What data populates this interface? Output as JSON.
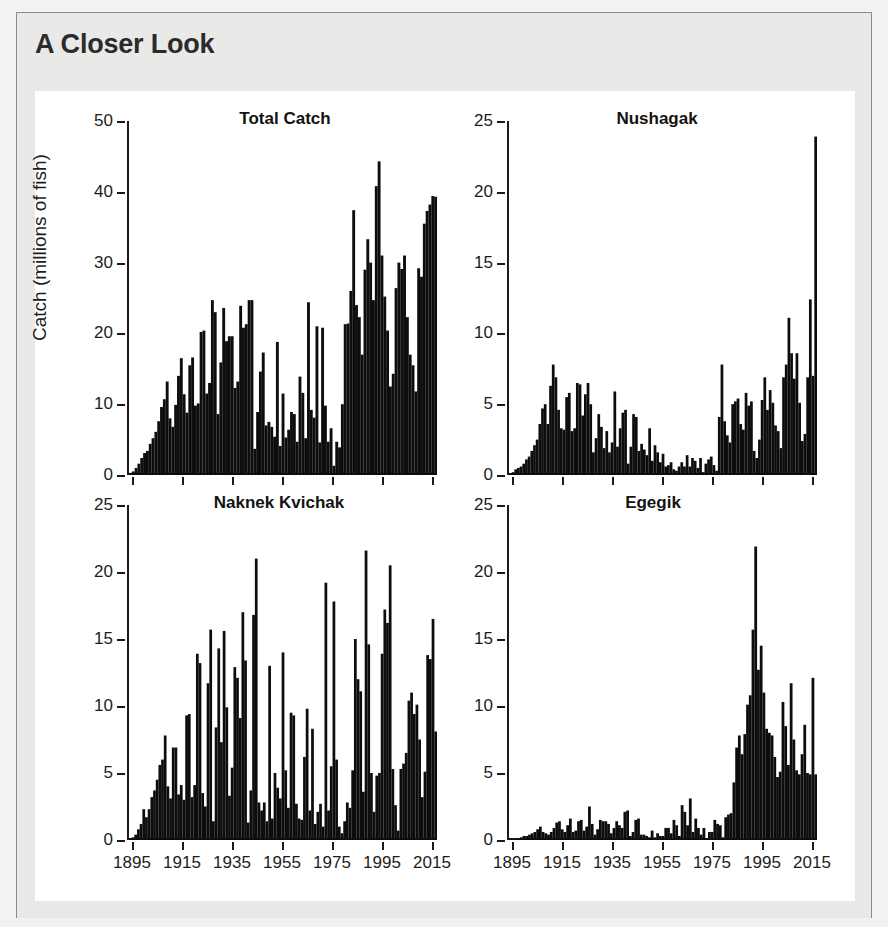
{
  "header": {
    "title": "A Closer Look"
  },
  "figure": {
    "y_axis_title": "Catch (millions of fish)"
  },
  "chart_data": [
    {
      "type": "bar",
      "panel": "top-left",
      "title": "Total Catch",
      "xlabel": "",
      "ylabel": "Catch (millions of fish)",
      "ylim": [
        0,
        50
      ],
      "yticks": [
        0,
        10,
        20,
        30,
        40,
        50
      ],
      "xlim": [
        1893,
        2017
      ],
      "xticks": [
        1895,
        1915,
        1935,
        1955,
        1975,
        1995,
        2015
      ],
      "grid": false,
      "legend": "none",
      "x": [
        1893,
        1894,
        1895,
        1896,
        1897,
        1898,
        1899,
        1900,
        1901,
        1902,
        1903,
        1904,
        1905,
        1906,
        1907,
        1908,
        1909,
        1910,
        1911,
        1912,
        1913,
        1914,
        1915,
        1916,
        1917,
        1918,
        1919,
        1920,
        1921,
        1922,
        1923,
        1924,
        1925,
        1926,
        1927,
        1928,
        1929,
        1930,
        1931,
        1932,
        1933,
        1934,
        1935,
        1936,
        1937,
        1938,
        1939,
        1940,
        1941,
        1942,
        1943,
        1944,
        1945,
        1946,
        1947,
        1948,
        1949,
        1950,
        1951,
        1952,
        1953,
        1954,
        1955,
        1956,
        1957,
        1958,
        1959,
        1960,
        1961,
        1962,
        1963,
        1964,
        1965,
        1966,
        1967,
        1968,
        1969,
        1970,
        1971,
        1972,
        1973,
        1974,
        1975,
        1976,
        1977,
        1978,
        1979,
        1980,
        1981,
        1982,
        1983,
        1984,
        1985,
        1986,
        1987,
        1988,
        1989,
        1990,
        1991,
        1992,
        1993,
        1994,
        1995,
        1996,
        1997,
        1998,
        1999,
        2000,
        2001,
        2002,
        2003,
        2004,
        2005,
        2006,
        2007,
        2008,
        2009,
        2010,
        2011,
        2012,
        2013,
        2014,
        2015,
        2016
      ],
      "values": [
        0.3,
        0.5,
        1.0,
        1.6,
        2.4,
        3.1,
        3.4,
        4.4,
        5.2,
        6.1,
        7.6,
        9.6,
        10.7,
        13.2,
        8.0,
        6.8,
        9.9,
        14.0,
        16.5,
        11.4,
        8.8,
        15.5,
        16.6,
        9.8,
        10.1,
        20.2,
        20.4,
        11.5,
        13.0,
        24.7,
        23.0,
        8.6,
        15.9,
        23.6,
        18.9,
        19.6,
        19.6,
        12.3,
        13.2,
        23.9,
        20.8,
        21.3,
        24.7,
        24.7,
        3.7,
        8.9,
        14.6,
        17.3,
        7.0,
        7.5,
        6.8,
        5.4,
        18.8,
        4.1,
        11.5,
        5.3,
        6.4,
        8.9,
        8.6,
        4.7,
        13.9,
        11.6,
        5.2,
        24.4,
        9.2,
        8.1,
        21.0,
        4.6,
        20.8,
        9.8,
        4.7,
        6.6,
        1.3,
        4.7,
        3.9,
        10.0,
        21.3,
        21.4,
        26.0,
        37.4,
        24.0,
        22.3,
        17.0,
        29.0,
        33.3,
        30.0,
        24.7,
        40.8,
        44.3,
        31.0,
        25.2,
        20.4,
        12.5,
        14.3,
        26.4,
        30.0,
        29.1,
        31.0,
        22.3,
        17.0,
        15.5,
        11.8,
        29.2,
        28.0,
        35.5,
        37.3,
        38.2,
        39.4,
        39.3
      ]
    },
    {
      "type": "bar",
      "panel": "top-right",
      "title": "Nushagak",
      "xlabel": "",
      "ylabel": "",
      "ylim": [
        0,
        25
      ],
      "yticks": [
        0,
        5,
        10,
        15,
        20,
        25
      ],
      "xlim": [
        1893,
        2017
      ],
      "xticks": [
        1895,
        1915,
        1935,
        1955,
        1975,
        1995,
        2015
      ],
      "grid": false,
      "legend": "none",
      "values": [
        0.1,
        0.2,
        0.4,
        0.5,
        0.6,
        0.8,
        1.1,
        1.3,
        1.7,
        2.1,
        2.5,
        3.6,
        4.7,
        5.0,
        3.6,
        6.3,
        7.8,
        6.9,
        4.6,
        3.3,
        3.2,
        5.5,
        5.8,
        3.1,
        3.3,
        6.5,
        6.4,
        4.2,
        5.7,
        6.5,
        5.0,
        1.6,
        2.6,
        4.3,
        3.4,
        1.9,
        3.1,
        1.6,
        2.3,
        5.9,
        2.0,
        3.3,
        4.4,
        4.6,
        0.8,
        2.0,
        4.3,
        4.1,
        1.7,
        2.2,
        1.8,
        1.4,
        3.3,
        1.0,
        2.1,
        1.6,
        0.9,
        1.5,
        0.6,
        0.7,
        0.9,
        0.4,
        0.3,
        0.6,
        0.9,
        0.6,
        1.4,
        0.6,
        1.2,
        1.0,
        0.5,
        1.2,
        0.2,
        0.8,
        1.1,
        1.3,
        0.7,
        0.3,
        4.1,
        7.8,
        3.8,
        2.8,
        2.3,
        5.0,
        5.2,
        5.4,
        3.6,
        3.2,
        5.8,
        4.9,
        5.2,
        1.7,
        1.2,
        2.5,
        5.3,
        6.9,
        4.6,
        6.0,
        5.1,
        3.5,
        3.1,
        1.9,
        6.9,
        7.8,
        11.1,
        8.6,
        6.8,
        8.6,
        5.1,
        2.4,
        2.9,
        6.9,
        12.4,
        7.0,
        23.9
      ]
    },
    {
      "type": "bar",
      "panel": "bottom-left",
      "title": "Naknek Kvichak",
      "xlabel": "",
      "ylabel": "",
      "ylim": [
        0,
        25
      ],
      "yticks": [
        0,
        5,
        10,
        15,
        20,
        25
      ],
      "xlim": [
        1893,
        2017
      ],
      "xticks": [
        1895,
        1915,
        1935,
        1955,
        1975,
        1995,
        2015
      ],
      "grid": false,
      "legend": "none",
      "values": [
        0.1,
        0.2,
        0.4,
        0.8,
        1.2,
        2.3,
        1.7,
        2.3,
        3.2,
        3.7,
        4.5,
        5.6,
        6.0,
        7.8,
        4.0,
        3.1,
        6.9,
        6.9,
        3.4,
        4.1,
        3.0,
        9.3,
        9.4,
        3.2,
        4.1,
        13.9,
        13.2,
        3.5,
        2.5,
        11.7,
        15.7,
        1.4,
        8.4,
        14.3,
        7.3,
        15.6,
        9.9,
        3.3,
        5.4,
        12.9,
        12.1,
        9.1,
        17.0,
        13.4,
        1.3,
        3.7,
        16.8,
        21.0,
        2.8,
        2.2,
        2.8,
        1.4,
        13.0,
        1.6,
        5.0,
        3.9,
        3.1,
        14.0,
        5.2,
        2.4,
        9.5,
        9.3,
        2.7,
        1.6,
        1.5,
        6.2,
        9.8,
        2.2,
        8.3,
        1.2,
        2.1,
        2.7,
        1.0,
        19.2,
        2.2,
        5.5,
        17.8,
        6.0,
        1.0,
        0.5,
        1.4,
        2.8,
        2.4,
        5.2,
        15.0,
        12.0,
        11.1,
        3.6,
        21.6,
        14.6,
        5.0,
        2.1,
        4.8,
        5.0,
        13.9,
        17.2,
        16.2,
        20.5,
        5.3,
        2.6,
        0.7,
        5.3,
        5.7,
        6.5,
        10.4,
        11.0,
        9.4,
        10.1,
        7.5,
        3.2,
        5.1,
        13.8,
        13.5,
        16.5,
        8.1
      ]
    },
    {
      "type": "bar",
      "panel": "bottom-right",
      "title": "Egegik",
      "xlabel": "",
      "ylabel": "",
      "ylim": [
        0,
        25
      ],
      "yticks": [
        0,
        5,
        10,
        15,
        20,
        25
      ],
      "xlim": [
        1893,
        2017
      ],
      "xticks": [
        1895,
        1915,
        1935,
        1955,
        1975,
        1995,
        2015
      ],
      "grid": false,
      "legend": "none",
      "values": [
        0.02,
        0.05,
        0.1,
        0.15,
        0.2,
        0.3,
        0.3,
        0.4,
        0.5,
        0.6,
        0.8,
        1.0,
        0.6,
        0.5,
        0.4,
        0.6,
        0.9,
        1.3,
        1.4,
        0.8,
        0.6,
        1.1,
        1.6,
        0.6,
        0.7,
        1.4,
        1.5,
        0.7,
        1.0,
        2.5,
        1.2,
        0.4,
        0.8,
        1.5,
        1.4,
        1.4,
        1.2,
        0.5,
        0.9,
        1.4,
        1.1,
        0.9,
        2.1,
        2.2,
        0.3,
        0.6,
        1.5,
        1.6,
        0.4,
        0.4,
        0.3,
        0.2,
        0.7,
        0.2,
        0.5,
        0.3,
        0.3,
        0.9,
        0.9,
        0.5,
        1.5,
        1.1,
        0.3,
        2.6,
        2.1,
        1.1,
        3.1,
        0.6,
        1.6,
        0.9,
        0.4,
        0.9,
        0.1,
        0.6,
        0.6,
        1.5,
        1.2,
        1.1,
        0.2,
        1.7,
        1.9,
        2.0,
        4.3,
        6.9,
        7.8,
        6.4,
        7.9,
        10.1,
        10.8,
        15.7,
        21.9,
        12.7,
        14.5,
        11.0,
        8.3,
        8.0,
        7.8,
        6.2,
        4.7,
        5.1,
        10.3,
        8.5,
        5.6,
        11.7,
        7.5,
        5.2,
        4.9,
        6.4,
        8.6,
        5.0,
        4.9,
        12.1,
        4.9
      ]
    }
  ]
}
